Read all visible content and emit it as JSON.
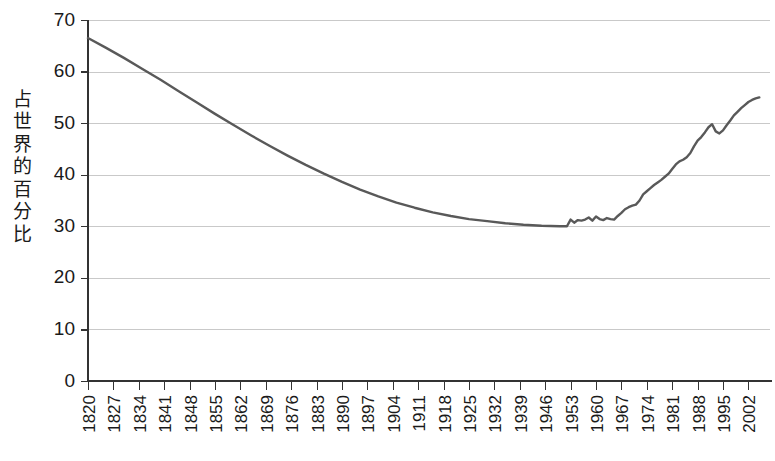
{
  "chart_data": {
    "type": "line",
    "title": "",
    "subtitle": "",
    "xlabel": "",
    "ylabel": "占世界的百分比",
    "ylim": [
      0,
      70
    ],
    "xlim": [
      1820,
      2005
    ],
    "grid": true,
    "legend": null,
    "legend_position": "none",
    "line_color": "#595959",
    "grid_color": "#c9c9c9",
    "axis_color": "#333333",
    "y_ticks": [
      70,
      60,
      50,
      40,
      30,
      20,
      10,
      0
    ],
    "y_tick_labels": [
      "70",
      "60",
      "50",
      "40",
      "30",
      "20",
      "10",
      "0"
    ],
    "x_ticks": [
      1820,
      1827,
      1834,
      1841,
      1848,
      1855,
      1862,
      1869,
      1876,
      1883,
      1890,
      1897,
      1904,
      1911,
      1918,
      1925,
      1932,
      1939,
      1946,
      1953,
      1960,
      1967,
      1974,
      1981,
      1988,
      1995,
      2002
    ],
    "x_tick_labels": [
      "1820",
      "1827",
      "1834",
      "1841",
      "1848",
      "1855",
      "1862",
      "1869",
      "1876",
      "1883",
      "1890",
      "1897",
      "1904",
      "1911",
      "1918",
      "1925",
      "1932",
      "1939",
      "1946",
      "1953",
      "1960",
      "1967",
      "1974",
      "1981",
      "1988",
      "1995",
      "2002"
    ],
    "series": [
      {
        "name": "占世界的百分比",
        "color": "#595959",
        "x": [
          1820,
          1825,
          1830,
          1835,
          1840,
          1845,
          1850,
          1855,
          1860,
          1865,
          1870,
          1875,
          1880,
          1885,
          1890,
          1895,
          1900,
          1905,
          1910,
          1915,
          1920,
          1925,
          1930,
          1935,
          1940,
          1945,
          1950,
          1952,
          1953,
          1954,
          1955,
          1956,
          1957,
          1958,
          1959,
          1960,
          1961,
          1962,
          1963,
          1964,
          1965,
          1966,
          1967,
          1968,
          1969,
          1970,
          1971,
          1972,
          1973,
          1974,
          1975,
          1976,
          1977,
          1978,
          1979,
          1980,
          1981,
          1982,
          1983,
          1984,
          1985,
          1986,
          1987,
          1988,
          1989,
          1990,
          1991,
          1992,
          1993,
          1994,
          1995,
          1996,
          1997,
          1998,
          1999,
          2000,
          2001,
          2002,
          2003,
          2004,
          2005
        ],
        "y": [
          66.5,
          64.6,
          62.6,
          60.5,
          58.4,
          56.2,
          54.0,
          51.8,
          49.7,
          47.6,
          45.6,
          43.7,
          41.9,
          40.2,
          38.6,
          37.1,
          35.8,
          34.6,
          33.6,
          32.7,
          32.0,
          31.4,
          31.0,
          30.6,
          30.3,
          30.1,
          30.0,
          30.0,
          31.3,
          30.7,
          31.2,
          31.1,
          31.3,
          31.7,
          31.1,
          31.9,
          31.4,
          31.2,
          31.6,
          31.4,
          31.3,
          32.0,
          32.6,
          33.3,
          33.7,
          34.0,
          34.2,
          35.0,
          36.2,
          36.8,
          37.4,
          38.0,
          38.5,
          39.0,
          39.6,
          40.2,
          41.1,
          42.0,
          42.6,
          42.9,
          43.4,
          44.2,
          45.5,
          46.6,
          47.3,
          48.2,
          49.2,
          49.8,
          48.4,
          48.0,
          48.6,
          49.6,
          50.5,
          51.5,
          52.2,
          52.9,
          53.5,
          54.1,
          54.5,
          54.8,
          55.0
        ],
        "start_value": 66.5,
        "min_value": 30.0,
        "min_range_years": "1940-1952",
        "end_value": 55.0
      }
    ]
  },
  "axis_title": {
    "characters": [
      "占",
      "世",
      "界",
      "的",
      "百",
      "分",
      "比"
    ]
  }
}
